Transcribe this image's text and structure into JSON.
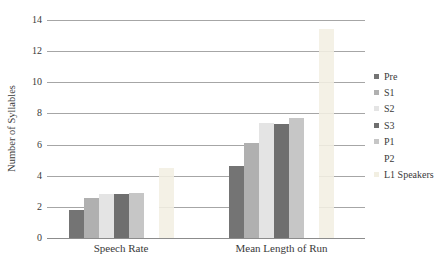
{
  "chart_data": {
    "type": "bar",
    "title": "",
    "xlabel": "",
    "ylabel": "Number of Syllables",
    "categories": [
      "Speech Rate",
      "Mean Length of Run"
    ],
    "series": [
      {
        "name": "Pre",
        "color": "#747474",
        "values": [
          1.8,
          4.6
        ]
      },
      {
        "name": "S1",
        "color": "#B0B0B0",
        "values": [
          2.6,
          6.1
        ]
      },
      {
        "name": "S2",
        "color": "#E4E4E4",
        "values": [
          2.8,
          7.4
        ]
      },
      {
        "name": "S3",
        "color": "#6F6F6F",
        "values": [
          2.8,
          7.3
        ]
      },
      {
        "name": "P1",
        "color": "#C6C6C6",
        "values": [
          2.9,
          7.7
        ]
      },
      {
        "name": "P2",
        "color": "#FFFFFF",
        "values": [
          2.9,
          7.4
        ]
      },
      {
        "name": "L1 Speakers",
        "color": "#F2EFE2",
        "opacity": 0.88,
        "values": [
          4.5,
          13.4
        ]
      }
    ],
    "ylim": [
      0,
      14
    ],
    "ytick_step": 2,
    "yticks": [
      0,
      2,
      4,
      6,
      8,
      10,
      12,
      14
    ],
    "grid": true,
    "legend_position": "right",
    "colors": {
      "gridline": "#A6A6A6",
      "axis_line": "#8C8C8C",
      "text": "#3A3A3A",
      "background": "#FFFFFF"
    }
  }
}
